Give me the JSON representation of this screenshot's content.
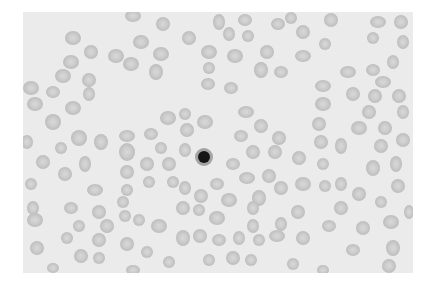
{
  "image": {
    "subject": "blood smear micrograph",
    "description": "Grayscale light micrograph of red blood cells with a single dark nucleated cell near the center",
    "colors": {
      "page_background": "#ffffff",
      "field_background": "#ebebeb",
      "rbc_fill": "#c4c4c4",
      "rbc_center": "#d6d6d6",
      "nucleus": "#1a1a1a",
      "nucleus_halo": "#9a9a9a"
    },
    "nucleated_cell": {
      "cx": 181,
      "cy": 145,
      "r_nucleus": 6,
      "r_halo": 9
    }
  }
}
